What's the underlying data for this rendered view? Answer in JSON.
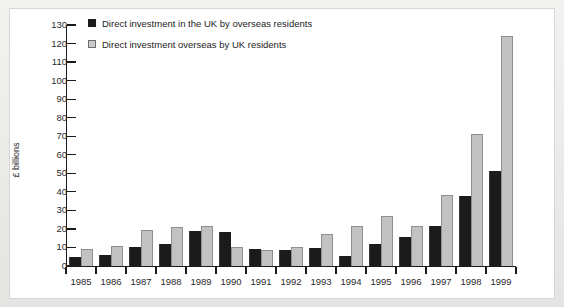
{
  "chart_data": {
    "type": "bar",
    "title": "",
    "subtitle": "",
    "xlabel": "",
    "ylabel": "£ billions",
    "ylim": [
      0,
      130
    ],
    "ytick_step": 10,
    "grid": false,
    "legend_position": "top-left",
    "categories": [
      "1985",
      "1986",
      "1987",
      "1988",
      "1989",
      "1990",
      "1991",
      "1992",
      "1993",
      "1994",
      "1995",
      "1996",
      "1997",
      "1998",
      "1999"
    ],
    "yticks": [
      "130",
      "120",
      "110",
      "100",
      "90",
      "80",
      "70",
      "60",
      "50",
      "40",
      "30",
      "20",
      "10",
      "0"
    ],
    "series": [
      {
        "name": "Direct investment in the UK by overseas residents",
        "color": "#1b1b1b",
        "values": [
          5,
          6,
          10,
          12,
          19,
          18.5,
          9,
          8.5,
          9.5,
          5.5,
          12,
          15.5,
          21.5,
          37.5,
          51.5
        ]
      },
      {
        "name": "Direct investment overseas by UK residents",
        "color": "#c2c2c2",
        "values": [
          9,
          11,
          19.5,
          21,
          21.5,
          10,
          8.5,
          10.5,
          17,
          21.5,
          27,
          21.5,
          38.5,
          71,
          124
        ]
      }
    ]
  },
  "colors": {
    "series_dark": "#1b1b1b",
    "series_light": "#c2c2c2",
    "axis": "#1a1a1a",
    "page_background": "#e8e8e6",
    "plot_background": "#ffffff"
  }
}
